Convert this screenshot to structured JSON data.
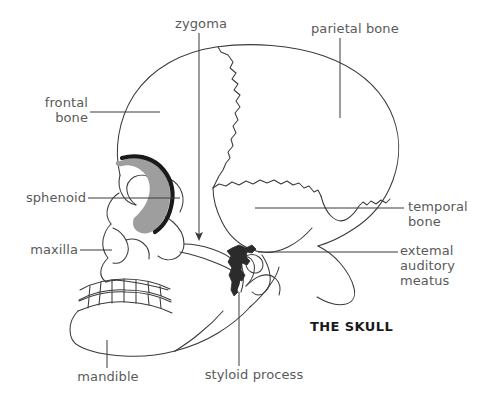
{
  "figure": {
    "title": "THE SKULL",
    "view": "lateral view line drawing of the human skull",
    "background_color": "#ffffff",
    "line_color": "#3a3a3a",
    "label_color": "#5a5a5a",
    "title_color": "#1a1a1a",
    "highlight_sphenoid_fill": "#9e9e9e",
    "highlight_sphenoid_stroke": "#1a1a1a",
    "highlight_styloid_fill": "#2b2b2b"
  },
  "labels": {
    "zygoma": {
      "text": "zygoma"
    },
    "parietal_bone": {
      "text": "parietal bone"
    },
    "frontal_bone": {
      "line1": "frontal",
      "line2": "bone"
    },
    "sphenoid": {
      "text": "sphenoid"
    },
    "maxilla": {
      "text": "maxilla"
    },
    "temporal_bone": {
      "line1": "temporal",
      "line2": "bone"
    },
    "external_auditory_meatus": {
      "line1": "extemal",
      "line2": "auditory",
      "line3": "meatus"
    },
    "mandible": {
      "text": "mandible"
    },
    "styloid_process": {
      "text": "styloid process"
    }
  }
}
